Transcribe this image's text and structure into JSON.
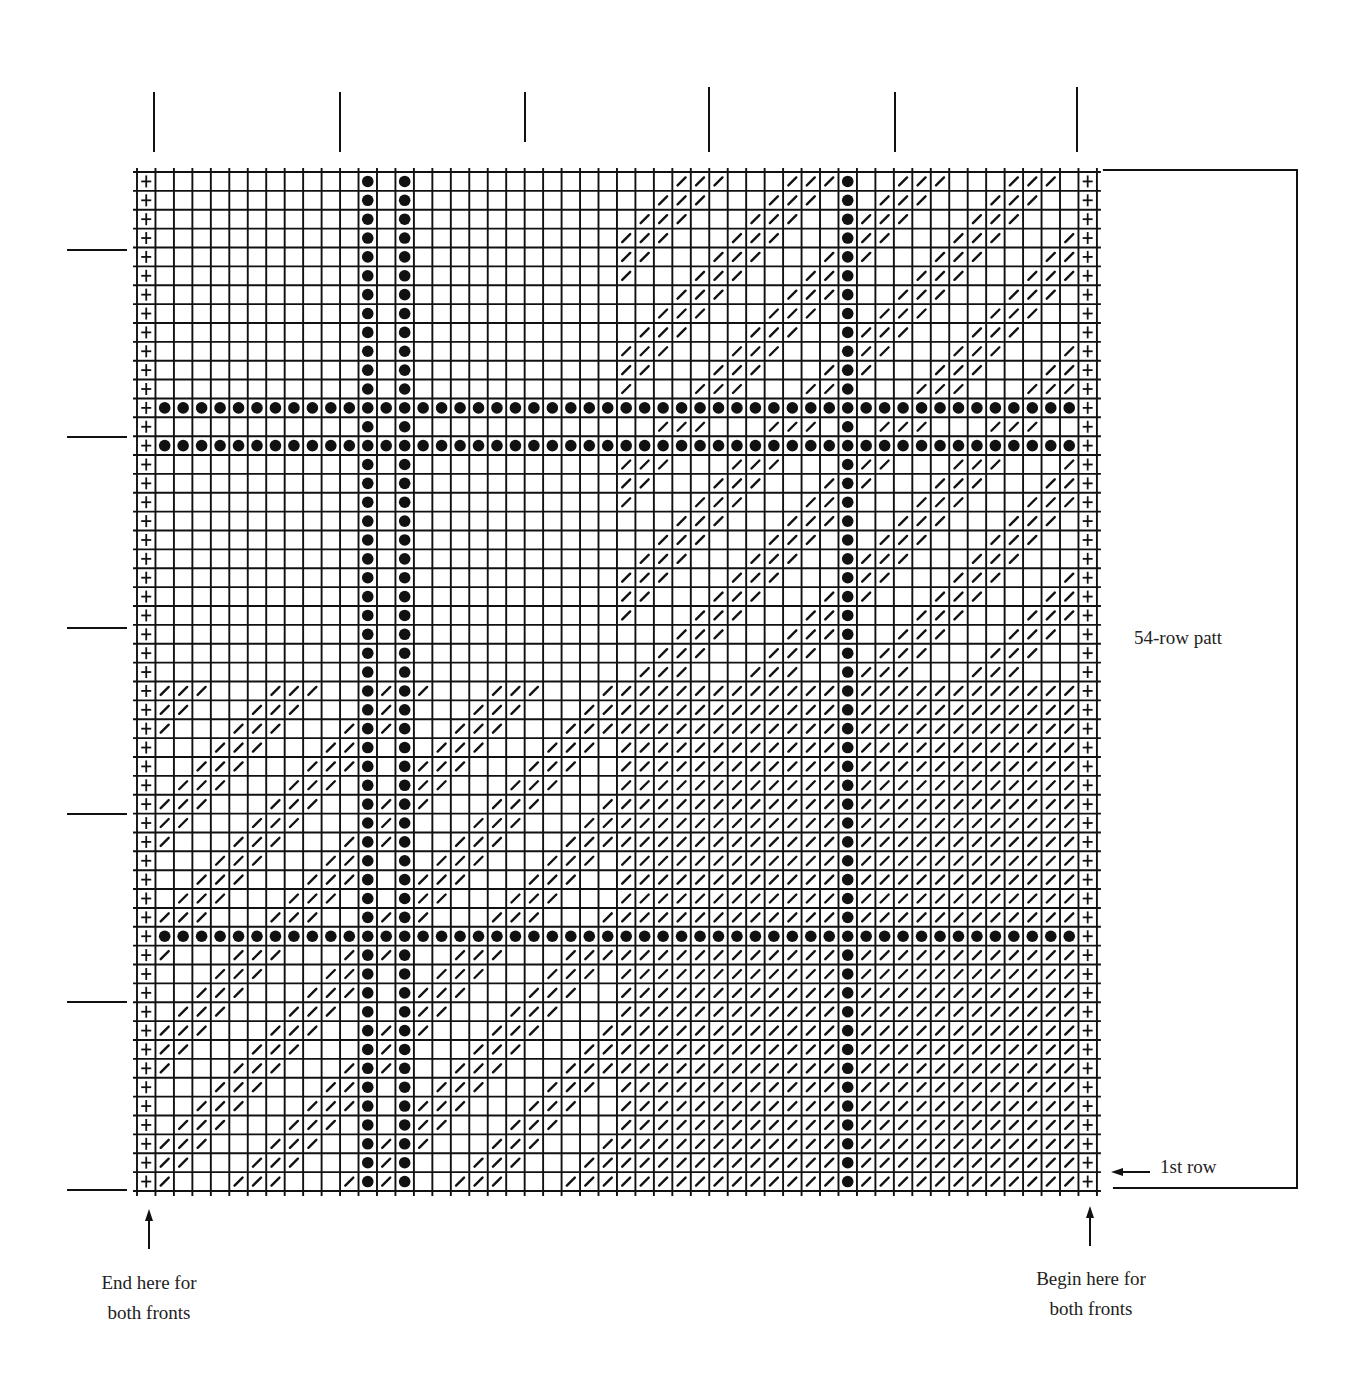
{
  "chart_data": {
    "type": "knitting-chart",
    "title": "",
    "grid": {
      "columns": 52,
      "rows": 54,
      "left": 137,
      "top": 172,
      "cell_width": 18.46,
      "cell_height": 18.87
    },
    "symbols": {
      "edge": "+",
      "dot": "●",
      "slash": "/",
      "empty": ""
    },
    "edge_columns": [
      0,
      51
    ],
    "dot_columns": [
      12,
      14,
      38
    ],
    "dot_rows": [
      12,
      14,
      40
    ],
    "regions": [
      {
        "name": "top-left",
        "rows": [
          0,
          26
        ],
        "cols": [
          1,
          25
        ],
        "fill": "empty"
      },
      {
        "name": "top-right",
        "rows": [
          0,
          26
        ],
        "cols": [
          26,
          50
        ],
        "fill": "diagonal",
        "rule": "(col+row) mod 6 in [5,0,1]"
      },
      {
        "name": "bottom-left",
        "rows": [
          27,
          53
        ],
        "cols": [
          1,
          25
        ],
        "fill": "diagonal",
        "rule": "(col+row) mod 6 in [4,5,0]"
      },
      {
        "name": "bottom-right",
        "rows": [
          27,
          53
        ],
        "cols": [
          26,
          50
        ],
        "fill": "full"
      }
    ],
    "diagonal_sets": {
      "top-right": [
        5,
        0,
        1
      ],
      "bottom-left": [
        4,
        5,
        0
      ]
    },
    "top_ticks_x": [
      154,
      340,
      525,
      709,
      895,
      1077
    ],
    "left_ticks_y": [
      250,
      437,
      628,
      814,
      1002,
      1190
    ],
    "repeat_rows": 54
  },
  "annotations": {
    "pattern_repeat": "54-row patt",
    "first_row": "1st row",
    "end_line1": "End here for",
    "end_line2": "both fronts",
    "begin_line1": "Begin here for",
    "begin_line2": "both fronts"
  },
  "colors": {
    "ink": "#111111",
    "background": "#ffffff"
  }
}
